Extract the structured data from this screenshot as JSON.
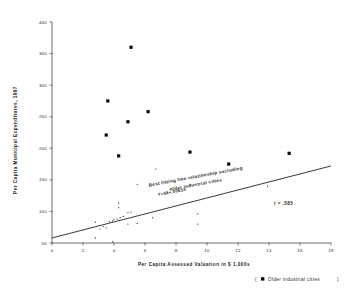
{
  "chart_data": {
    "type": "scatter",
    "title": "",
    "xlabel": "Per Capita Assessed Valuation in $ 1,000s",
    "ylabel": "Per Capita Municipal Expenditures, 1967",
    "xlim": [
      0,
      18
    ],
    "ylim": [
      50,
      400
    ],
    "xticks": [
      0,
      2,
      4,
      6,
      8,
      10,
      12,
      14,
      16,
      18
    ],
    "xtick_labels": [
      "0",
      "2",
      "4",
      "6",
      "8",
      "10",
      "12",
      "14",
      "16",
      "18"
    ],
    "yticks": [
      50,
      100,
      150,
      200,
      250,
      300,
      350,
      400
    ],
    "ytick_labels": [
      "50",
      "100",
      "150",
      "200",
      "250",
      "300",
      "350",
      "400"
    ],
    "grid": false,
    "legend_position": "bottom-right",
    "series": [
      {
        "name": "Older industrial cities",
        "marker": "filled-square",
        "marker_size": 3.2,
        "color": "#0a0a0a",
        "points": [
          {
            "x": 5.1,
            "y": 360
          },
          {
            "x": 3.6,
            "y": 275
          },
          {
            "x": 6.2,
            "y": 258
          },
          {
            "x": 4.9,
            "y": 242
          },
          {
            "x": 3.5,
            "y": 221
          },
          {
            "x": 4.3,
            "y": 188
          },
          {
            "x": 8.9,
            "y": 194
          },
          {
            "x": 11.4,
            "y": 175
          },
          {
            "x": 15.3,
            "y": 192
          }
        ]
      },
      {
        "name": "Other cities",
        "marker": "small-dot",
        "marker_size": 1.0,
        "color": "#2a2a2a",
        "points": [
          {
            "x": 5.5,
            "y": 143
          },
          {
            "x": 6.7,
            "y": 167
          },
          {
            "x": 8.9,
            "y": 143
          },
          {
            "x": 13.9,
            "y": 140
          },
          {
            "x": 4.3,
            "y": 106
          },
          {
            "x": 4.3,
            "y": 113
          },
          {
            "x": 4.9,
            "y": 98
          },
          {
            "x": 5.1,
            "y": 99
          },
          {
            "x": 4.6,
            "y": 92
          },
          {
            "x": 4.4,
            "y": 90
          },
          {
            "x": 4.2,
            "y": 88
          },
          {
            "x": 4.0,
            "y": 87
          },
          {
            "x": 3.9,
            "y": 85
          },
          {
            "x": 3.7,
            "y": 84
          },
          {
            "x": 4.9,
            "y": 80
          },
          {
            "x": 5.5,
            "y": 81
          },
          {
            "x": 6.5,
            "y": 90
          },
          {
            "x": 9.4,
            "y": 96
          },
          {
            "x": 9.4,
            "y": 80
          },
          {
            "x": 2.8,
            "y": 83
          },
          {
            "x": 3.3,
            "y": 76
          },
          {
            "x": 3.5,
            "y": 74
          },
          {
            "x": 3.1,
            "y": 72
          },
          {
            "x": 2.8,
            "y": 58
          },
          {
            "x": 3.9,
            "y": 52
          }
        ]
      }
    ],
    "fit_line": {
      "label": "Best fitting line relationship excluding older industrial cities",
      "equation": "Y=58+.0063X",
      "r_value": "r = .585",
      "x_start": 0,
      "y_start": 58,
      "x_end": 18,
      "y_end": 172
    }
  },
  "legend": {
    "open_paren": "(",
    "marker_label": "Older industrial cities",
    "close_paren": ")"
  }
}
